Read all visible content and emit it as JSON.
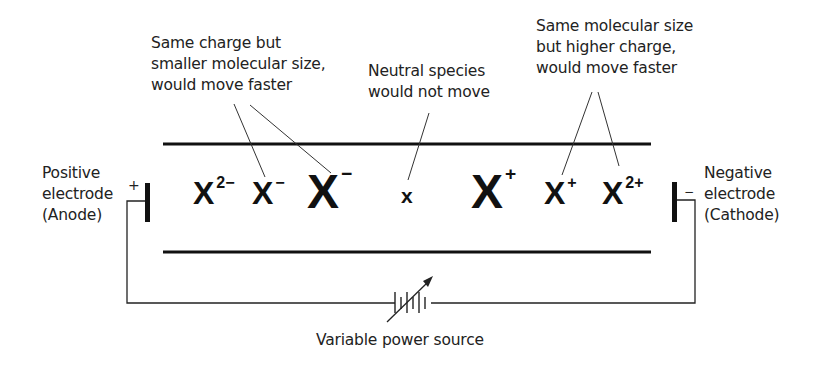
{
  "diagram": {
    "type": "electrophoresis schematic",
    "annotations": {
      "smaller_size": [
        "Same charge but",
        "smaller molecular size,",
        "would move faster"
      ],
      "neutral": [
        "Neutral species",
        "would not move"
      ],
      "higher_charge": [
        "Same molecular size",
        "but higher charge,",
        "would move faster"
      ]
    },
    "electrodes": {
      "positive": {
        "lines": [
          "Positive",
          "electrode",
          "(Anode)"
        ],
        "sign": "+"
      },
      "negative": {
        "lines": [
          "Negative",
          "electrode",
          "(Cathode)"
        ],
        "sign": "−"
      }
    },
    "species": [
      {
        "base": "X",
        "charge": "2−",
        "size": "small"
      },
      {
        "base": "X",
        "charge": "−",
        "size": "small"
      },
      {
        "base": "X",
        "charge": "−",
        "size": "large"
      },
      {
        "base": "x",
        "charge": "",
        "size": "tiny"
      },
      {
        "base": "X",
        "charge": "+",
        "size": "large"
      },
      {
        "base": "X",
        "charge": "+",
        "size": "small"
      },
      {
        "base": "X",
        "charge": "2+",
        "size": "small"
      }
    ],
    "power_source": {
      "label": "Variable power source"
    },
    "colors": {
      "line": "#111111",
      "text": "#222222",
      "background": "#ffffff"
    }
  }
}
